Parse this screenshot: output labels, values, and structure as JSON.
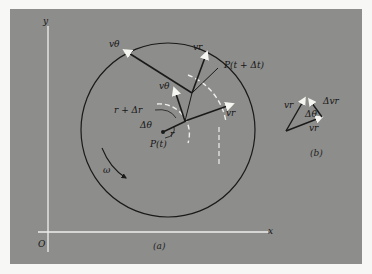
{
  "figure": {
    "panel_a": {
      "caption": "(a)",
      "axes": {
        "x_label": "x",
        "y_label": "y",
        "origin_label": "O"
      },
      "labels": {
        "v_theta_outer": "vθ",
        "v_r_outer": "vr",
        "point_later": "P(t + Δt)",
        "v_theta_inner": "vθ",
        "r_plus_dr": "r + Δr",
        "dtheta": "Δθ",
        "r": "r",
        "v_r_inner": "vr",
        "point_now": "P(t)",
        "omega": "ω"
      }
    },
    "panel_b": {
      "caption": "(b)",
      "labels": {
        "v_r_prime": "vr",
        "delta_v_r": "Δvr",
        "dtheta": "Δθ",
        "v_r": "vr"
      }
    },
    "colors": {
      "background": "#8d8d8b",
      "ink": "#1a1a1a",
      "white_lines": "#efefec"
    }
  }
}
